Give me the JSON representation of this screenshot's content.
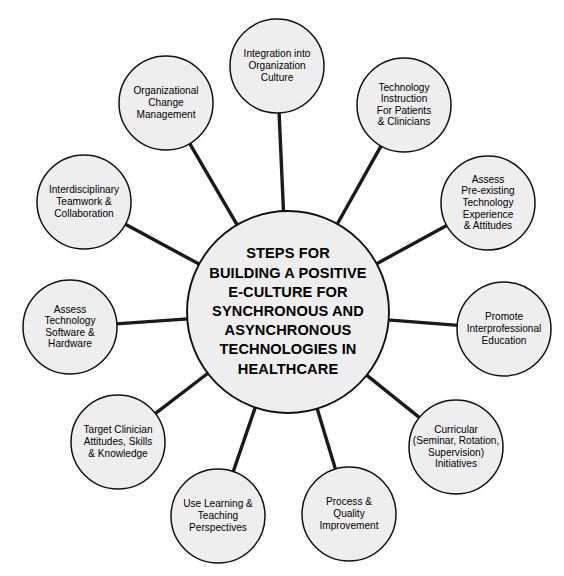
{
  "canvas": {
    "width": 564,
    "height": 576,
    "background": "#ffffff"
  },
  "style": {
    "node_fill": "#eeeeee",
    "node_stroke": "#111111",
    "spoke_color": "#1a1a1a",
    "text_color": "#000000"
  },
  "center": {
    "name": "central-hub",
    "cx": 288,
    "cy": 312,
    "r": 101,
    "lines": [
      "STEPS FOR",
      "BUILDING A POSITIVE",
      "E-CULTURE FOR",
      "SYNCHRONOUS AND",
      "ASYNCHRONOUS",
      "TECHNOLOGIES IN",
      "HEALTHCARE"
    ],
    "text": "STEPS FOR BUILDING A POSITIVE E-CULTURE FOR SYNCHRONOUS AND ASYNCHRONOUS TECHNOLOGIES IN HEALTHCARE"
  },
  "nodes": [
    {
      "id": "integration-into-organization-culture",
      "cx": 277,
      "cy": 66,
      "r": 47,
      "lines": [
        "Integration into",
        "Organization",
        "Culture"
      ],
      "text": "Integration into Organization Culture"
    },
    {
      "id": "technology-instruction-for-patients-clinicians",
      "cx": 404,
      "cy": 105,
      "r": 47,
      "lines": [
        "Technology",
        "Instruction",
        "For Patients",
        "& Clinicians"
      ],
      "text": "Technology Instruction For Patients & Clinicians"
    },
    {
      "id": "assess-pre-existing-technology-experience-attitudes",
      "cx": 488,
      "cy": 203,
      "r": 47,
      "lines": [
        "Assess",
        "Pre-existing",
        "Technology",
        "Experience",
        "& Attitudes"
      ],
      "text": "Assess Pre-existing Technology Experience & Attitudes"
    },
    {
      "id": "promote-interprofessional-education",
      "cx": 504,
      "cy": 329,
      "r": 47,
      "lines": [
        "Promote",
        "Interprofessional",
        "Education"
      ],
      "text": "Promote Interprofessional Education"
    },
    {
      "id": "curricular-seminar-rotation-supervision-initiatives",
      "cx": 456,
      "cy": 447,
      "r": 47,
      "lines": [
        "Curricular",
        "(Seminar, Rotation,",
        "Supervision)",
        "Initiatives"
      ],
      "text": "Curricular (Seminar, Rotation, Supervision) Initiatives"
    },
    {
      "id": "process-quality-improvement",
      "cx": 349,
      "cy": 514,
      "r": 47,
      "lines": [
        "Process &",
        "Quality",
        "Improvement"
      ],
      "text": "Process & Quality Improvement"
    },
    {
      "id": "use-learning-teaching-perspectives",
      "cx": 218,
      "cy": 516,
      "r": 47,
      "lines": [
        "Use Learning &",
        "Teaching",
        "Perspectives"
      ],
      "text": "Use Learning & Teaching Perspectives"
    },
    {
      "id": "target-clinician-attitudes-skills-knowledge",
      "cx": 118,
      "cy": 442,
      "r": 47,
      "lines": [
        "Target Clinician",
        "Attitudes, Skills",
        "& Knowledge"
      ],
      "text": "Target Clinician Attitudes, Skills & Knowledge"
    },
    {
      "id": "assess-technology-software-hardware",
      "cx": 70,
      "cy": 327,
      "r": 47,
      "lines": [
        "Assess",
        "Technology",
        "Software &",
        "Hardware"
      ],
      "text": "Assess Technology Software & Hardware"
    },
    {
      "id": "interdisciplinary-teamwork-collaboration",
      "cx": 84,
      "cy": 202,
      "r": 47,
      "lines": [
        "Interdisciplinary",
        "Teamwork &",
        "Collaboration"
      ],
      "text": "Interdisciplinary Teamwork & Collaboration"
    },
    {
      "id": "organizational-change-management",
      "cx": 166,
      "cy": 103,
      "r": 47,
      "lines": [
        "Organizational",
        "Change",
        "Management"
      ],
      "text": "Organizational Change Management"
    }
  ]
}
